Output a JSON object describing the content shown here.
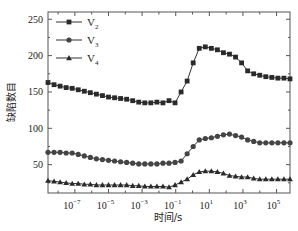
{
  "chart_data": {
    "type": "line",
    "title": "",
    "xlabel": "时间/s",
    "ylabel": "缺陷数目",
    "xscale": "log",
    "xlim_log10": [
      -8.6,
      5.8
    ],
    "ylim": [
      11,
      260
    ],
    "x_ticks": [
      {
        "exp": "-7",
        "label": "10",
        "sup": "−7"
      },
      {
        "exp": "-5",
        "label": "10",
        "sup": "−5"
      },
      {
        "exp": "-3",
        "label": "10",
        "sup": "−3"
      },
      {
        "exp": "-1",
        "label": "10",
        "sup": "−1"
      },
      {
        "exp": "1",
        "label": "10",
        "sup": "1"
      },
      {
        "exp": "3",
        "label": "10",
        "sup": "3"
      },
      {
        "exp": "5",
        "label": "10",
        "sup": "5"
      }
    ],
    "y_ticks": [
      50,
      100,
      150,
      200,
      250
    ],
    "grid": false,
    "legend_position": "upper-left",
    "x_log10": [
      -8.6,
      -8.24,
      -7.88,
      -7.52,
      -7.16,
      -6.8,
      -6.44,
      -6.08,
      -5.72,
      -5.36,
      -5.0,
      -4.64,
      -4.28,
      -3.92,
      -3.56,
      -3.2,
      -2.84,
      -2.48,
      -2.12,
      -1.76,
      -1.4,
      -1.04,
      -0.68,
      -0.32,
      0.04,
      0.4,
      0.76,
      1.12,
      1.48,
      1.84,
      2.2,
      2.56,
      2.92,
      3.28,
      3.64,
      4.0,
      4.36,
      4.72,
      5.08,
      5.44,
      5.8
    ],
    "series": [
      {
        "name": "V2",
        "label": "V",
        "sub": "2",
        "marker": "square",
        "values": [
          163,
          160,
          158,
          156,
          155,
          153,
          151,
          149,
          147,
          145,
          143,
          142,
          141,
          140,
          138,
          136,
          135,
          135,
          136,
          135,
          138,
          135,
          150,
          165,
          190,
          210,
          212,
          210,
          208,
          204,
          202,
          198,
          190,
          179,
          175,
          173,
          171,
          170,
          169,
          169,
          168
        ]
      },
      {
        "name": "V3",
        "label": "V",
        "sub": "3",
        "marker": "circle",
        "values": [
          67,
          67,
          67,
          66,
          66,
          64,
          62,
          60,
          58,
          57,
          56,
          55,
          54,
          53,
          52,
          51,
          51,
          51,
          51,
          52,
          52,
          53,
          55,
          65,
          75,
          84,
          86,
          87,
          89,
          91,
          92,
          90,
          88,
          84,
          82,
          80,
          80,
          80,
          80,
          80,
          80
        ]
      },
      {
        "name": "V4",
        "label": "V",
        "sub": "4",
        "marker": "triangle",
        "values": [
          28,
          27,
          26,
          25,
          24,
          24,
          23,
          23,
          22,
          22,
          22,
          22,
          22,
          22,
          21,
          21,
          20,
          20,
          20,
          20,
          19,
          22,
          26,
          30,
          36,
          40,
          41,
          41,
          40,
          38,
          35,
          34,
          33,
          33,
          31,
          30,
          30,
          30,
          30,
          30,
          30
        ]
      }
    ]
  }
}
